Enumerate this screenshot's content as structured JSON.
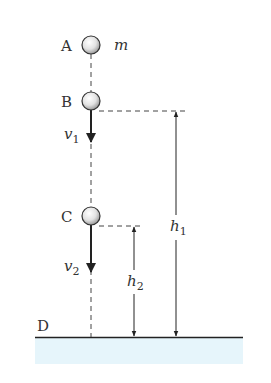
{
  "diagram": {
    "points": [
      {
        "id": "A",
        "label": "A"
      },
      {
        "id": "B",
        "label": "B"
      },
      {
        "id": "C",
        "label": "C"
      },
      {
        "id": "D",
        "label": "D"
      }
    ],
    "mass_label": "m",
    "velocities": [
      {
        "symbol": "v",
        "subscript": "1"
      },
      {
        "symbol": "v",
        "subscript": "2"
      }
    ],
    "heights": [
      {
        "symbol": "h",
        "subscript": "1"
      },
      {
        "symbol": "h",
        "subscript": "2"
      }
    ],
    "colors": {
      "ground_fill": "#e6f5fb",
      "line": "#222222",
      "ball_highlight": "#ffffff",
      "ball_shadow": "#9a9a9a"
    }
  }
}
